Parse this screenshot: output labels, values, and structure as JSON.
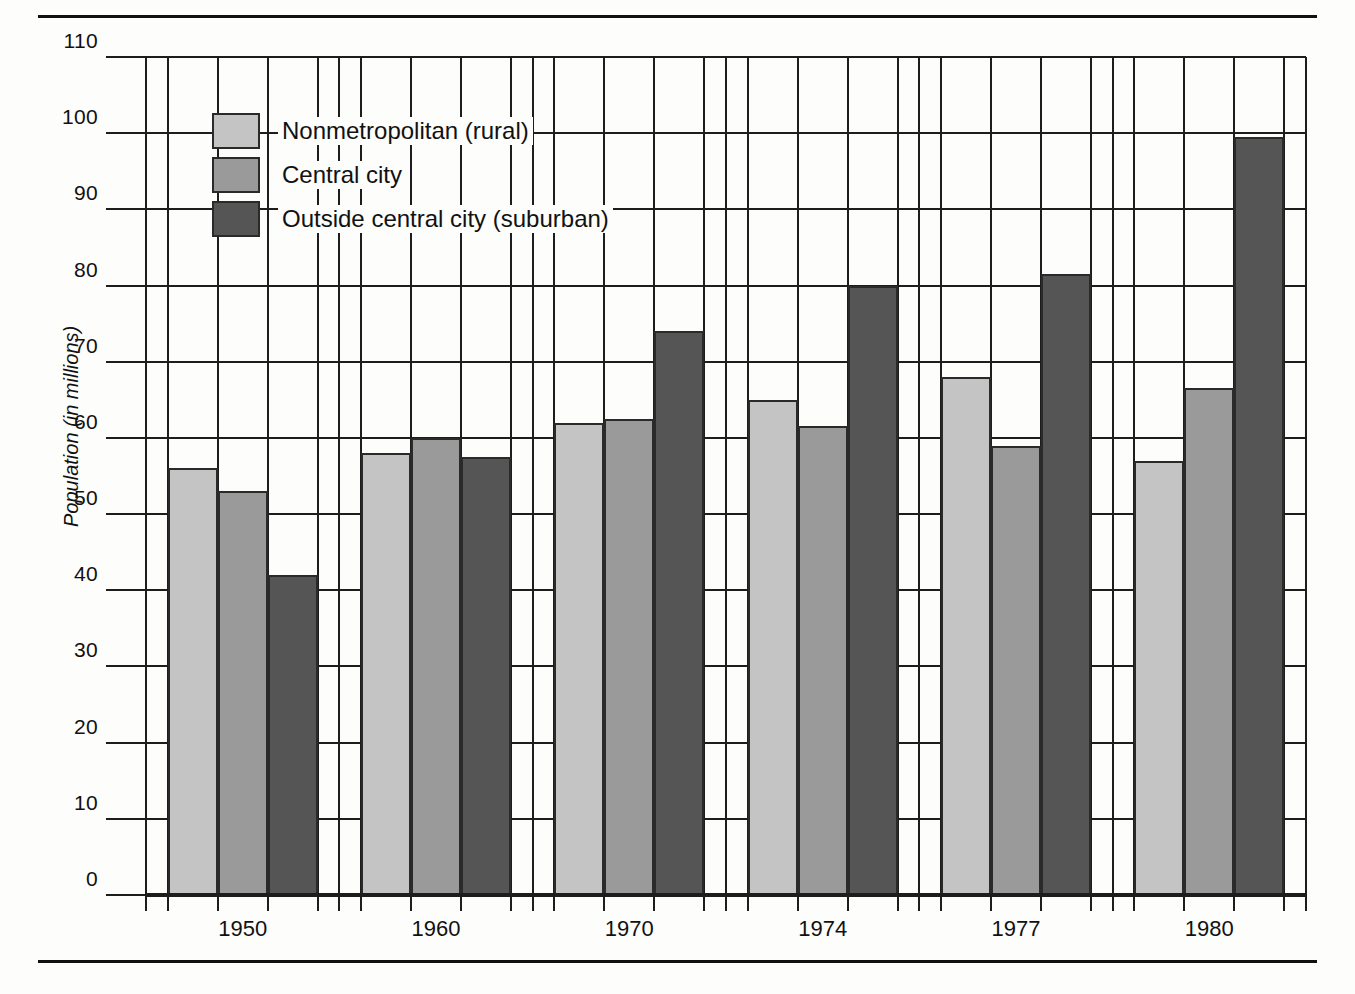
{
  "figure": {
    "ylabel": "Population (in millions)"
  },
  "legend": {
    "items": [
      {
        "label": "Nonmetropolitan (rural)",
        "color": "#c4c4c4",
        "key": "nonmetropolitan"
      },
      {
        "label": "Central city",
        "color": "#9a9a9a",
        "key": "central_city"
      },
      {
        "label": "Outside central city (suburban)",
        "color": "#555555",
        "key": "suburban"
      }
    ]
  },
  "chart_data": {
    "type": "bar",
    "title": "",
    "xlabel": "",
    "ylabel": "Population (in millions)",
    "ylim": [
      0,
      110
    ],
    "yticks": [
      0,
      10,
      20,
      30,
      40,
      50,
      60,
      70,
      80,
      90,
      100,
      110
    ],
    "ytick_labels": [
      "0",
      "10",
      "20",
      "30",
      "40",
      "50",
      "60",
      "70",
      "80",
      "90",
      "100",
      "110"
    ],
    "grid": true,
    "legend_position": "upper-left",
    "categories": [
      "1950",
      "1960",
      "1970",
      "1974",
      "1977",
      "1980"
    ],
    "series": [
      {
        "name": "Nonmetropolitan (rural)",
        "color": "#c4c4c4",
        "values": [
          56,
          58,
          62,
          65,
          68,
          57
        ]
      },
      {
        "name": "Central city",
        "color": "#9a9a9a",
        "values": [
          53,
          60,
          62.5,
          61.5,
          59,
          66.5
        ]
      },
      {
        "name": "Outside central city (suburban)",
        "color": "#555555",
        "values": [
          42,
          57.5,
          74,
          80,
          81.5,
          99.5
        ]
      }
    ]
  }
}
